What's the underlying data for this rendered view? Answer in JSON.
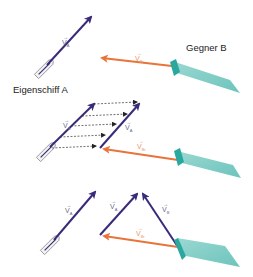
{
  "labels": {
    "own_ship": "Eigenschiff A",
    "opponent": "Gegner B"
  },
  "vectors": {
    "v_a": {
      "symbol": "V",
      "sub": "A"
    },
    "v_b": {
      "symbol": "V",
      "sub": "B"
    },
    "v_br": {
      "symbol": "V",
      "sub": "Br"
    }
  },
  "colors": {
    "own_vector": "#3a2a7a",
    "relative_vector": "#e8743a",
    "ship_b_fill": "#7fcfc8",
    "ship_b_edge": "#2aa8a0",
    "boat_outline": "#888888",
    "dashed": "#333333"
  },
  "panels": [
    {
      "name": "panel-1",
      "description": "Own ship A with velocity vector and opponent B relative vector"
    },
    {
      "name": "panel-2",
      "description": "Parallel shift of V_A along relative motion"
    },
    {
      "name": "panel-3",
      "description": "Vector triangle V_A, V_B, V_Br"
    }
  ]
}
